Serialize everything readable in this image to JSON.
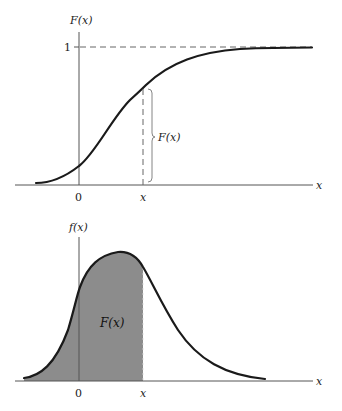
{
  "top_chart": {
    "y_axis_label": "F(x)",
    "x_axis_label": "x",
    "y_tick_one": "1",
    "x_tick_zero": "0",
    "x_tick_x": "x",
    "bracket_label": "F(x)",
    "curve_type": "cumulative distribution function (sigmoid)",
    "asymptote_value": 1
  },
  "bottom_chart": {
    "y_axis_label": "f(x)",
    "x_axis_label": "x",
    "x_tick_zero": "0",
    "x_tick_x": "x",
    "area_label": "F(x)",
    "curve_type": "probability density function (bell-shaped)",
    "shade_color": "#8c8c8c"
  },
  "colors": {
    "curve": "#1a1a1a",
    "axis": "#555555",
    "dashed": "#666666",
    "background": "#ffffff"
  }
}
